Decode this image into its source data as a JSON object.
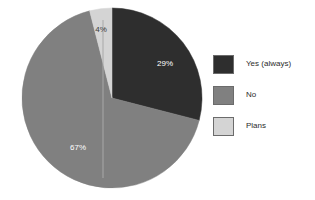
{
  "chart_data": {
    "type": "pie",
    "title": "",
    "labels": [
      "Yes (always)",
      "No",
      "Plans"
    ],
    "values": [
      29,
      67,
      4
    ],
    "value_labels": [
      "29%",
      "67%",
      "4%"
    ],
    "colors": [
      "#2e2e2e",
      "#808080",
      "#d4d4d4"
    ],
    "start_angle_deg": 0,
    "direction": "clockwise",
    "legend_position": "right",
    "grid": false,
    "units": "percent",
    "slices": [
      {
        "label": "Yes (always)",
        "value": 29,
        "value_label": "29%",
        "color": "#2e2e2e",
        "label_x": 165,
        "label_y": 64,
        "label_fill": "on-dark"
      },
      {
        "label": "No",
        "value": 67,
        "value_label": "67%",
        "color": "#808080",
        "label_x": 78,
        "label_y": 148,
        "label_fill": "on-gray"
      },
      {
        "label": "Plans",
        "value": 4,
        "value_label": "4%",
        "color": "#d4d4d4",
        "label_x": 101,
        "label_y": 30,
        "label_fill": "on-light"
      }
    ],
    "geometry": {
      "center_x": 112,
      "center_y": 98,
      "radius": 90
    }
  },
  "legend": {
    "items": [
      {
        "label": "Yes (always)",
        "color": "#2e2e2e"
      },
      {
        "label": "No",
        "color": "#808080"
      },
      {
        "label": "Plans",
        "color": "#d4d4d4"
      }
    ]
  }
}
